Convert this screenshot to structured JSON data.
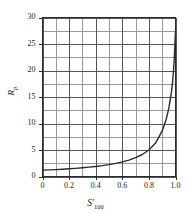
{
  "chart_data": {
    "type": "line",
    "title": "",
    "xlabel": "S'100",
    "xlabel_base": "S",
    "xlabel_prime": "′",
    "xlabel_sub": "100",
    "ylabel": "Rp",
    "ylabel_base": "R",
    "ylabel_sub": "p",
    "xlim": [
      0,
      1.0
    ],
    "ylim": [
      0,
      30
    ],
    "xticks": [
      "0",
      "0.2",
      "0.4",
      "0.6",
      "0.8",
      "1.0"
    ],
    "xtick_values": [
      0,
      0.2,
      0.4,
      0.6,
      0.8,
      1.0
    ],
    "yticks": [
      "0",
      "5",
      "10",
      "15",
      "20",
      "25",
      "30"
    ],
    "ytick_values": [
      0,
      5,
      10,
      15,
      20,
      25,
      30
    ],
    "grid": true,
    "grid_x_step": 0.1,
    "grid_y_step": 2.5,
    "legend": "none",
    "series": [
      {
        "name": "Rp",
        "color": "#2b2b2b",
        "x": [
          0.0,
          0.05,
          0.1,
          0.15,
          0.2,
          0.25,
          0.3,
          0.35,
          0.4,
          0.45,
          0.5,
          0.55,
          0.6,
          0.65,
          0.7,
          0.75,
          0.8,
          0.85,
          0.9,
          0.93,
          0.95,
          0.97,
          0.98,
          0.99,
          1.0
        ],
        "values": [
          1.2,
          1.25,
          1.3,
          1.37,
          1.45,
          1.54,
          1.64,
          1.76,
          1.9,
          2.06,
          2.25,
          2.48,
          2.76,
          3.1,
          3.55,
          4.15,
          5.0,
          6.3,
          8.6,
          10.8,
          12.9,
          16.0,
          18.3,
          21.8,
          27.5
        ]
      }
    ]
  },
  "axes": {
    "x_axis_name": "x-axis",
    "y_axis_name": "y-axis"
  }
}
